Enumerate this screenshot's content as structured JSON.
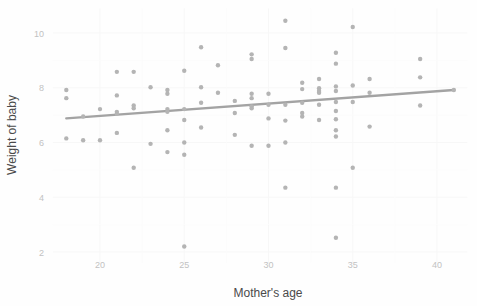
{
  "chart_data": {
    "type": "scatter",
    "title": "",
    "xlabel": "Mother's age",
    "ylabel": "Weight of baby",
    "xlim": [
      17.2,
      41.8
    ],
    "ylim": [
      1.6,
      10.9
    ],
    "xticks": [
      20,
      25,
      30,
      35,
      40
    ],
    "yticks": [
      2,
      4,
      6,
      8,
      10
    ],
    "grid": true,
    "legend": null,
    "point_color": "#b4b4b4",
    "line_color": "#a3a3a3",
    "background_color": "#fefefe",
    "gridline_color": "#f7f7f7",
    "tick_label_color": "#c2c2c2",
    "axis_title_color": "#4a4a4a",
    "point_radius": 2.2,
    "trendline": {
      "type": "linear",
      "x_start": 18.0,
      "y_start": 6.88,
      "x_end": 41.0,
      "y_end": 7.92,
      "slope": 0.0452,
      "intercept": 6.066,
      "width": 2.4
    },
    "points": [
      {
        "x": 18.0,
        "y": 7.92
      },
      {
        "x": 18.0,
        "y": 7.62
      },
      {
        "x": 18.0,
        "y": 6.15
      },
      {
        "x": 19.0,
        "y": 6.95
      },
      {
        "x": 19.0,
        "y": 6.08
      },
      {
        "x": 20.0,
        "y": 7.22
      },
      {
        "x": 20.0,
        "y": 6.08
      },
      {
        "x": 21.0,
        "y": 8.58
      },
      {
        "x": 21.0,
        "y": 7.72
      },
      {
        "x": 21.0,
        "y": 7.12
      },
      {
        "x": 21.0,
        "y": 7.05
      },
      {
        "x": 21.0,
        "y": 6.35
      },
      {
        "x": 22.0,
        "y": 8.58
      },
      {
        "x": 22.0,
        "y": 7.35
      },
      {
        "x": 22.0,
        "y": 7.25
      },
      {
        "x": 22.0,
        "y": 5.08
      },
      {
        "x": 23.0,
        "y": 8.02
      },
      {
        "x": 23.0,
        "y": 5.95
      },
      {
        "x": 24.0,
        "y": 7.92
      },
      {
        "x": 24.0,
        "y": 7.78
      },
      {
        "x": 24.0,
        "y": 7.22
      },
      {
        "x": 24.0,
        "y": 7.12
      },
      {
        "x": 24.0,
        "y": 6.45
      },
      {
        "x": 24.0,
        "y": 5.65
      },
      {
        "x": 25.0,
        "y": 8.62
      },
      {
        "x": 25.0,
        "y": 7.22
      },
      {
        "x": 25.0,
        "y": 6.82
      },
      {
        "x": 25.0,
        "y": 6.0
      },
      {
        "x": 25.0,
        "y": 5.55
      },
      {
        "x": 25.0,
        "y": 2.2
      },
      {
        "x": 26.0,
        "y": 9.48
      },
      {
        "x": 26.0,
        "y": 8.02
      },
      {
        "x": 26.0,
        "y": 7.45
      },
      {
        "x": 26.0,
        "y": 6.55
      },
      {
        "x": 27.0,
        "y": 8.82
      },
      {
        "x": 27.0,
        "y": 7.82
      },
      {
        "x": 28.0,
        "y": 7.52
      },
      {
        "x": 28.0,
        "y": 7.08
      },
      {
        "x": 28.0,
        "y": 6.28
      },
      {
        "x": 29.0,
        "y": 9.22
      },
      {
        "x": 29.0,
        "y": 9.05
      },
      {
        "x": 29.0,
        "y": 7.78
      },
      {
        "x": 29.0,
        "y": 7.62
      },
      {
        "x": 29.0,
        "y": 7.32
      },
      {
        "x": 29.0,
        "y": 7.25
      },
      {
        "x": 29.0,
        "y": 5.88
      },
      {
        "x": 30.0,
        "y": 7.78
      },
      {
        "x": 30.0,
        "y": 7.38
      },
      {
        "x": 30.0,
        "y": 6.88
      },
      {
        "x": 30.0,
        "y": 5.88
      },
      {
        "x": 31.0,
        "y": 10.45
      },
      {
        "x": 31.0,
        "y": 9.45
      },
      {
        "x": 31.0,
        "y": 7.38
      },
      {
        "x": 31.0,
        "y": 6.8
      },
      {
        "x": 31.0,
        "y": 6.0
      },
      {
        "x": 31.0,
        "y": 4.35
      },
      {
        "x": 32.0,
        "y": 8.18
      },
      {
        "x": 32.0,
        "y": 7.95
      },
      {
        "x": 32.0,
        "y": 7.45
      },
      {
        "x": 32.0,
        "y": 7.08
      },
      {
        "x": 32.0,
        "y": 6.95
      },
      {
        "x": 33.0,
        "y": 8.32
      },
      {
        "x": 33.0,
        "y": 7.98
      },
      {
        "x": 33.0,
        "y": 7.88
      },
      {
        "x": 33.0,
        "y": 7.82
      },
      {
        "x": 33.0,
        "y": 7.38
      },
      {
        "x": 33.0,
        "y": 6.82
      },
      {
        "x": 34.0,
        "y": 9.28
      },
      {
        "x": 34.0,
        "y": 8.88
      },
      {
        "x": 34.0,
        "y": 8.05
      },
      {
        "x": 34.0,
        "y": 7.88
      },
      {
        "x": 34.0,
        "y": 7.48
      },
      {
        "x": 34.0,
        "y": 7.15
      },
      {
        "x": 34.0,
        "y": 6.85
      },
      {
        "x": 34.0,
        "y": 6.45
      },
      {
        "x": 34.0,
        "y": 6.22
      },
      {
        "x": 34.0,
        "y": 4.35
      },
      {
        "x": 34.0,
        "y": 2.52
      },
      {
        "x": 35.0,
        "y": 10.22
      },
      {
        "x": 35.0,
        "y": 8.08
      },
      {
        "x": 35.0,
        "y": 7.48
      },
      {
        "x": 35.0,
        "y": 5.08
      },
      {
        "x": 36.0,
        "y": 8.32
      },
      {
        "x": 36.0,
        "y": 7.82
      },
      {
        "x": 36.0,
        "y": 6.58
      },
      {
        "x": 39.0,
        "y": 9.05
      },
      {
        "x": 39.0,
        "y": 8.38
      },
      {
        "x": 39.0,
        "y": 7.35
      },
      {
        "x": 41.0,
        "y": 7.92
      }
    ]
  }
}
